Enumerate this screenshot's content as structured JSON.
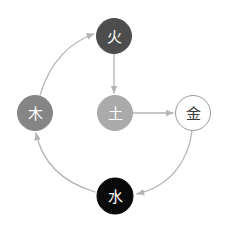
{
  "diagram": {
    "background_color": "#ffffff",
    "edge_color": "#b4b4b4",
    "nodes": [
      {
        "id": "fire",
        "label": "火",
        "element_name": "Fire",
        "cx": 114,
        "cy": 36,
        "r": 17.5,
        "fill": "#4d4d4d",
        "stroke": "#4d4d4d",
        "text_color": "#ffffff",
        "font_size": 15
      },
      {
        "id": "wood",
        "label": "木",
        "element_name": "Wood",
        "cx": 35,
        "cy": 113,
        "r": 17.5,
        "fill": "#858585",
        "stroke": "#858585",
        "text_color": "#ffffff",
        "font_size": 15
      },
      {
        "id": "earth",
        "label": "土",
        "element_name": "Earth",
        "cx": 115,
        "cy": 113,
        "r": 17.5,
        "fill": "#aaaaaa",
        "stroke": "#aaaaaa",
        "text_color": "#ffffff",
        "font_size": 15
      },
      {
        "id": "metal",
        "label": "金",
        "element_name": "Metal",
        "cx": 193,
        "cy": 113,
        "r": 17.5,
        "fill": "#ffffff",
        "stroke": "#9a9a9a",
        "text_color": "#3a3a3a",
        "font_size": 15
      },
      {
        "id": "water",
        "label": "水",
        "element_name": "Water",
        "cx": 115,
        "cy": 196,
        "r": 18,
        "fill": "#0a0a0a",
        "stroke": "#0a0a0a",
        "text_color": "#ffffff",
        "font_size": 15
      }
    ],
    "edges": [
      {
        "id": "wood-to-fire",
        "from": "wood",
        "to": "fire",
        "shape": "curved",
        "path": "M 40 95 C 50 62, 70 42, 94 34"
      },
      {
        "id": "fire-to-earth",
        "from": "fire",
        "to": "earth",
        "shape": "straight",
        "path": "M 114 54 L 114 93"
      },
      {
        "id": "earth-to-metal",
        "from": "earth",
        "to": "metal",
        "shape": "straight",
        "path": "M 133 113 L 173 113"
      },
      {
        "id": "metal-to-water",
        "from": "metal",
        "to": "water",
        "shape": "curved",
        "path": "M 192 131 C 188 162, 170 186, 137 194"
      },
      {
        "id": "water-to-wood",
        "from": "water",
        "to": "wood",
        "shape": "curved",
        "path": "M 95 192 C 62 182, 42 162, 36 133"
      }
    ]
  }
}
